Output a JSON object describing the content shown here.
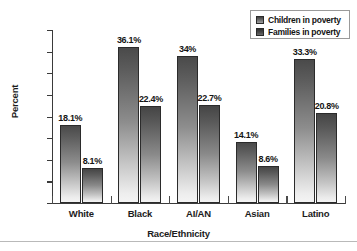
{
  "chart_data": {
    "type": "bar",
    "title": "",
    "subtitle": "",
    "xlabel": "Race/Ethnicity",
    "ylabel": "Percent",
    "categories": [
      "White",
      "Black",
      "AI/AN",
      "Asian",
      "Latino"
    ],
    "series": [
      {
        "name": "Children in poverty",
        "values": [
          18.1,
          36.1,
          34,
          14.1,
          33.3
        ],
        "labels": [
          "18.1%",
          "36.1%",
          "34%",
          "14.1%",
          "33.3%"
        ]
      },
      {
        "name": "Families in poverty",
        "values": [
          8.1,
          22.4,
          22.7,
          8.6,
          20.8
        ],
        "labels": [
          "8.1%",
          "22.4%",
          "22.7%",
          "8.6%",
          "20.8%"
        ]
      }
    ],
    "ylim": [
      0,
      40
    ],
    "yticks": [
      0,
      5,
      10,
      15,
      20,
      25,
      30,
      35,
      40
    ],
    "ytick_labels": [
      "0",
      "5",
      "10",
      "15",
      "20",
      "25",
      "30",
      "35",
      "40"
    ],
    "grid": false,
    "legend_position": "top-right",
    "colors": {
      "series_a": "#6f6f6f",
      "series_b": "#4a4a4a",
      "axis": "#3a3a3a",
      "text": "#141414",
      "background": "#ffffff",
      "legend_border": "#9a9a9a",
      "bottom_rule": "#b9b9b9"
    }
  },
  "legend": {
    "items": [
      {
        "label": "Children in poverty"
      },
      {
        "label": "Families in poverty"
      }
    ]
  },
  "axes": {
    "y_title": "Percent",
    "x_title": "Race/Ethnicity"
  }
}
